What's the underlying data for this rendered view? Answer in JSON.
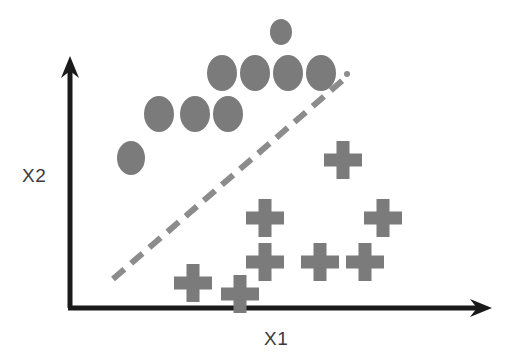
{
  "figure": {
    "kind": "scatter-plot-diagram",
    "width": 518,
    "height": 358,
    "background_color": "#ffffff"
  },
  "axes": {
    "x_label": "X1",
    "y_label": "X2",
    "color": "#1a1a1a",
    "stroke_width": 5,
    "origin": {
      "x": 70,
      "y": 308
    },
    "x_axis_end": {
      "x": 492,
      "y": 308
    },
    "y_axis_end": {
      "x": 70,
      "y": 56
    },
    "x_label_position": {
      "x": 264,
      "y": 329
    },
    "y_label_position": {
      "x": 22,
      "y": 166
    }
  },
  "boundary_line": {
    "name": "decision-boundary",
    "style": "dashed",
    "color": "#8c8c8c",
    "stroke_width": 6,
    "dash_pattern": "15 9",
    "start": {
      "x": 113,
      "y": 279
    },
    "end": {
      "x": 343,
      "y": 80
    },
    "end_dot": {
      "x": 347,
      "y": 74,
      "r": 3
    }
  },
  "chart_data": {
    "type": "scatter",
    "title": "",
    "xlabel": "X1",
    "ylabel": "X2",
    "grid": false,
    "legend": "none",
    "axis_ticks": [],
    "marker_color": "#7b7b7b",
    "annotations": [
      {
        "type": "line",
        "label": "dashed separating hyperplane",
        "style": "dashed"
      }
    ],
    "series": [
      {
        "name": "class-ellipse",
        "marker": "ellipse",
        "color": "#7b7b7b",
        "points": [
          {
            "x": 281,
            "y": 32,
            "rx": 11,
            "ry": 13
          },
          {
            "x": 222,
            "y": 73,
            "rx": 15,
            "ry": 18
          },
          {
            "x": 255,
            "y": 73,
            "rx": 15,
            "ry": 18
          },
          {
            "x": 288,
            "y": 73,
            "rx": 15,
            "ry": 18
          },
          {
            "x": 321,
            "y": 73,
            "rx": 15,
            "ry": 18
          },
          {
            "x": 159,
            "y": 114,
            "rx": 15,
            "ry": 18
          },
          {
            "x": 195,
            "y": 114,
            "rx": 15,
            "ry": 18
          },
          {
            "x": 228,
            "y": 114,
            "rx": 15,
            "ry": 18
          },
          {
            "x": 131,
            "y": 158,
            "rx": 14,
            "ry": 17
          }
        ]
      },
      {
        "name": "class-cross",
        "marker": "plus",
        "color": "#7b7b7b",
        "points": [
          {
            "x": 343,
            "y": 160,
            "size": 38,
            "arm": 13
          },
          {
            "x": 265,
            "y": 218,
            "size": 38,
            "arm": 13
          },
          {
            "x": 383,
            "y": 218,
            "size": 38,
            "arm": 13
          },
          {
            "x": 265,
            "y": 262,
            "size": 38,
            "arm": 13
          },
          {
            "x": 320,
            "y": 262,
            "size": 38,
            "arm": 13
          },
          {
            "x": 365,
            "y": 262,
            "size": 38,
            "arm": 13
          },
          {
            "x": 193,
            "y": 283,
            "size": 38,
            "arm": 13
          },
          {
            "x": 240,
            "y": 294,
            "size": 38,
            "arm": 13
          }
        ]
      }
    ]
  }
}
